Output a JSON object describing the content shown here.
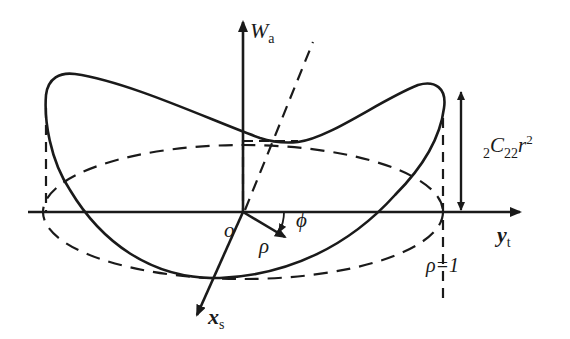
{
  "diagram": {
    "colors": {
      "stroke": "#1a1a1a",
      "background": "#ffffff"
    },
    "axes": {
      "vertical": {
        "symbol": "W",
        "subscript": "a"
      },
      "horizontal": {
        "symbol": "y",
        "subscript": "t"
      },
      "oblique": {
        "symbol": "x",
        "subscript": "s"
      }
    },
    "labels": {
      "origin": "o",
      "radius": "ρ",
      "angle": "ϕ",
      "rim_label": "ρ=1",
      "height": {
        "prefix_sub": "2",
        "symbol": "C",
        "sub": "22",
        "var": "r",
        "sup": "2"
      }
    },
    "elements": [
      "solid saddle-shaped aberration surface outline",
      "dashed unit-pupil ellipse (ρ=1) in base plane",
      "dashed vertical projection lines at left and right extremes",
      "dashed oblique line through origin",
      "double-headed height arrow marking amplitude"
    ]
  }
}
